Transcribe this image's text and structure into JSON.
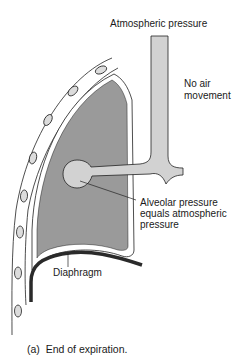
{
  "figure": {
    "labels": {
      "atmospheric": "Atmospheric pressure",
      "no_air_1": "No air",
      "no_air_2": "movement",
      "alveolar_1": "Alveolar pressure",
      "alveolar_2": "equals atmospheric",
      "alveolar_3": "pressure",
      "diaphragm": "Diaphragm"
    },
    "caption": "(a)  End of expiration.",
    "colors": {
      "lung_fill": "#9a9a9a",
      "airway_fill": "#d2d2d2",
      "rib_fill": "#dcdcdc",
      "diaphragm": "#2a2a2a",
      "line": "#222222"
    }
  }
}
